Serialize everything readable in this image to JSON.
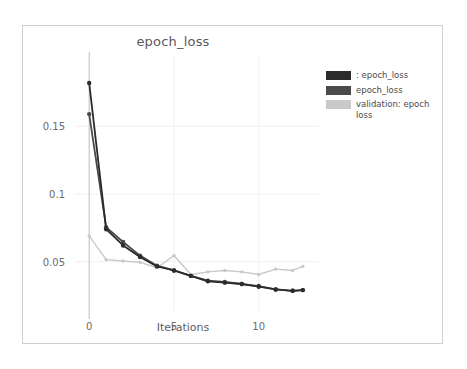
{
  "card": {
    "border_color": "#cfcfcf",
    "background": "#ffffff"
  },
  "chart_data": {
    "type": "line",
    "title": "epoch_loss",
    "xlabel": "Iterations",
    "ylabel": "",
    "xlim": [
      -0.6,
      13.2
    ],
    "ylim": [
      0.018,
      0.196
    ],
    "xticks": [
      0,
      5,
      10
    ],
    "xticklabels": [
      "0",
      "5",
      "10"
    ],
    "yticks": [
      0.05,
      0.1,
      0.15
    ],
    "yticklabels": [
      "0.05",
      "0.1",
      "0.15"
    ],
    "grid": true,
    "grid_color": "#f0f0f0",
    "legend_position": "right-outside",
    "x": [
      0,
      1,
      2,
      3,
      4,
      5,
      6,
      7,
      8,
      9,
      10,
      11,
      12,
      12.6
    ],
    "series": [
      {
        "name": ": epoch_loss",
        "color": "#2b2b2b",
        "values": [
          0.182,
          0.074,
          0.062,
          0.0535,
          0.0465,
          0.0435,
          0.0395,
          0.0355,
          0.0345,
          0.0335,
          0.0315,
          0.0295,
          0.0285,
          0.029
        ]
      },
      {
        "name": "epoch_loss",
        "color": "#4a4a4a",
        "values": [
          0.159,
          0.0755,
          0.0645,
          0.0545,
          0.047,
          0.0435,
          0.0395,
          0.036,
          0.035,
          0.0335,
          0.032,
          0.0295,
          0.0285,
          0.029
        ]
      },
      {
        "name": "validation: epoch loss",
        "color": "#c9c9c9",
        "values": [
          0.069,
          0.0515,
          0.0505,
          0.0495,
          0.0455,
          0.0545,
          0.0405,
          0.0425,
          0.0435,
          0.0425,
          0.0405,
          0.0445,
          0.0435,
          0.0465
        ]
      }
    ]
  },
  "legend": {
    "items": [
      {
        "label": ": epoch_loss",
        "color": "#2b2b2b"
      },
      {
        "label": "epoch_loss",
        "color": "#4a4a4a"
      },
      {
        "label": "validation: epoch loss",
        "color": "#c9c9c9"
      }
    ]
  }
}
